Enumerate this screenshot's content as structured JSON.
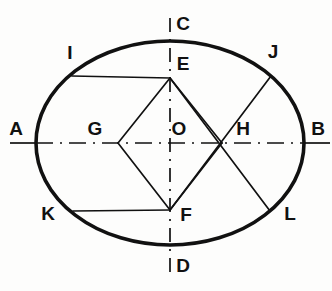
{
  "figure": {
    "type": "geometric-diagram",
    "width": 332,
    "height": 291,
    "background_color": "#fdfdfc",
    "stroke_color": "#111111",
    "ellipse_stroke_width": 3.6,
    "chord_stroke_width": 1.6,
    "axis_stroke_width": 1.6
  },
  "ellipse": {
    "center_x": 170,
    "center_y": 143,
    "radius_x": 134,
    "radius_y": 102
  },
  "axes": {
    "major": {
      "name": "horizontal-center-line",
      "x1": 10,
      "y1": 143,
      "x2": 330,
      "y2": 143,
      "style": "center-line"
    },
    "minor": {
      "name": "vertical-center-line",
      "x1": 170,
      "y1": 18,
      "x2": 170,
      "y2": 272,
      "style": "center-line"
    }
  },
  "points": [
    {
      "id": "A",
      "label": "A",
      "px": 36,
      "py": 143,
      "label_x": 16,
      "label_y": 128
    },
    {
      "id": "B",
      "label": "B",
      "px": 304,
      "py": 143,
      "label_x": 318,
      "label_y": 128
    },
    {
      "id": "C",
      "label": "C",
      "px": 170,
      "py": 41,
      "label_x": 183,
      "label_y": 23
    },
    {
      "id": "D",
      "label": "D",
      "px": 170,
      "py": 245,
      "label_x": 183,
      "label_y": 265
    },
    {
      "id": "E",
      "label": "E",
      "px": 170,
      "py": 78,
      "label_x": 183,
      "label_y": 63
    },
    {
      "id": "F",
      "label": "F",
      "px": 170,
      "py": 210,
      "label_x": 186,
      "label_y": 214
    },
    {
      "id": "G",
      "label": "G",
      "px": 118,
      "py": 143,
      "label_x": 95,
      "label_y": 128
    },
    {
      "id": "H",
      "label": "H",
      "px": 222,
      "py": 143,
      "label_x": 243,
      "label_y": 128
    },
    {
      "id": "O",
      "label": "O",
      "px": 170,
      "py": 143,
      "label_x": 179,
      "label_y": 128
    },
    {
      "id": "I",
      "label": "I",
      "px": 72,
      "py": 76,
      "label_x": 70,
      "label_y": 52
    },
    {
      "id": "J",
      "label": "J",
      "px": 271,
      "py": 76,
      "label_x": 273,
      "label_y": 51
    },
    {
      "id": "K",
      "label": "K",
      "px": 73,
      "py": 211,
      "label_x": 48,
      "label_y": 213
    },
    {
      "id": "L",
      "label": "L",
      "px": 270,
      "py": 211,
      "label_x": 290,
      "label_y": 213
    }
  ],
  "chords": [
    {
      "name": "chord-E-G-extended-to-I",
      "from": "E",
      "to": "I",
      "x1": 170,
      "y1": 78,
      "x2": 72,
      "y2": 76
    },
    {
      "name": "chord-E-H-extended-to-L",
      "from": "E",
      "to": "L",
      "x1": 170,
      "y1": 78,
      "x2": 270,
      "y2": 211
    },
    {
      "name": "chord-F-G-extended-to-K",
      "from": "F",
      "to": "K",
      "x1": 170,
      "y1": 210,
      "x2": 73,
      "y2": 211
    },
    {
      "name": "chord-F-H-extended-to-J",
      "from": "F",
      "to": "J",
      "x1": 170,
      "y1": 210,
      "x2": 271,
      "y2": 76
    }
  ]
}
